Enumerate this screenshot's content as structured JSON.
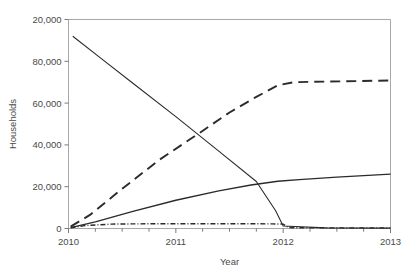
{
  "chart_data": {
    "type": "line",
    "title": "",
    "xlabel": "Year",
    "ylabel": "Households",
    "xlim": [
      2010,
      2013
    ],
    "ylim": [
      0,
      100000
    ],
    "grid": false,
    "legend": "none",
    "x_ticks": [
      2010,
      2011,
      2012,
      2013
    ],
    "x_tick_labels": [
      "2010",
      "2011",
      "2012",
      "2013"
    ],
    "x_minor_ticks": [
      2010.25,
      2010.5,
      2010.75,
      2011.25,
      2011.5,
      2011.75,
      2012.25,
      2012.5,
      2012.75
    ],
    "y_ticks": [
      0,
      20000,
      40000,
      60000,
      80000,
      100000
    ],
    "y_tick_labels": [
      "0",
      "20,000",
      "40,000",
      "60,000",
      "80,000",
      "20,000"
    ],
    "series": [
      {
        "name": "declining",
        "style": "solid",
        "color": "#2b2b2b",
        "width": 1.1,
        "x": [
          2010.04,
          2010.3,
          2010.6,
          2011.0,
          2011.4,
          2011.75,
          2011.93,
          2012.0,
          2012.4,
          2013.0
        ],
        "values": [
          92000,
          81500,
          69500,
          53500,
          37000,
          22500,
          8500,
          1200,
          300,
          200
        ]
      },
      {
        "name": "rising-dashed",
        "style": "dashed",
        "color": "#2b2b2b",
        "width": 1.9,
        "x": [
          2010.02,
          2010.2,
          2010.5,
          2010.85,
          2011.2,
          2011.5,
          2011.75,
          2011.95,
          2012.1,
          2012.4,
          2013.0
        ],
        "values": [
          900,
          6500,
          19000,
          33000,
          45000,
          55500,
          63000,
          68500,
          70000,
          70300,
          70800
        ]
      },
      {
        "name": "rising-solid",
        "style": "solid",
        "color": "#2b2b2b",
        "width": 1.4,
        "x": [
          2010.02,
          2010.25,
          2010.6,
          2011.0,
          2011.4,
          2011.7,
          2011.95,
          2012.15,
          2012.5,
          2013.0
        ],
        "values": [
          400,
          3200,
          8200,
          13500,
          18000,
          20800,
          22600,
          23400,
          24600,
          26000
        ]
      },
      {
        "name": "flat-dashdot",
        "style": "dashdot",
        "color": "#2b2b2b",
        "width": 1.4,
        "x": [
          2010.02,
          2010.15,
          2010.4,
          2010.8,
          2011.2,
          2011.6,
          2011.9,
          2012.0,
          2012.05,
          2012.3,
          2013.0
        ],
        "values": [
          300,
          1400,
          2100,
          2300,
          2300,
          2300,
          2200,
          2100,
          400,
          300,
          300
        ]
      }
    ]
  },
  "axis": {
    "y_title": "Households",
    "x_title": "Year"
  }
}
